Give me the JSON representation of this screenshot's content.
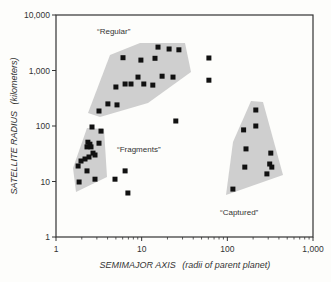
{
  "chart_data": {
    "type": "scatter",
    "title": "",
    "xlabel": "SEMIMAJOR AXIS",
    "xlabel_units": "(radii of parent planet)",
    "ylabel": "SATELLITE RADIUS",
    "ylabel_units": "(kilometers)",
    "xscale": "log",
    "yscale": "log",
    "xlim": [
      1,
      1000
    ],
    "ylim": [
      1,
      10000
    ],
    "xticks": [
      {
        "v": 1,
        "label": "1"
      },
      {
        "v": 10,
        "label": "10"
      },
      {
        "v": 100,
        "label": "100"
      },
      {
        "v": 1000,
        "label": "1,000"
      }
    ],
    "yticks": [
      {
        "v": 1,
        "label": "1"
      },
      {
        "v": 10,
        "label": "10"
      },
      {
        "v": 100,
        "label": "100"
      },
      {
        "v": 1000,
        "label": "1,000"
      },
      {
        "v": 10000,
        "label": "10,000"
      }
    ],
    "grid": false,
    "colors": {
      "marker": "#111111",
      "region": "#cfcfcf",
      "axis": "#333333"
    },
    "regions": [
      {
        "name": "“Regular”",
        "label_pos": [
          97,
          34
        ],
        "polygon": [
          [
            110,
            55
          ],
          [
            140,
            43
          ],
          [
            185,
            43
          ],
          [
            191,
            72
          ],
          [
            148,
            103
          ],
          [
            100,
            117
          ],
          [
            88,
            113
          ]
        ]
      },
      {
        "name": "“Fragments”",
        "label_pos": [
          117,
          152
        ],
        "polygon": [
          [
            87,
            128
          ],
          [
            104,
            129
          ],
          [
            107,
            177
          ],
          [
            76,
            192
          ],
          [
            73,
            168
          ]
        ]
      },
      {
        "name": "“Captured”",
        "label_pos": [
          220,
          215
        ],
        "polygon": [
          [
            251,
            101
          ],
          [
            263,
            102
          ],
          [
            283,
            175
          ],
          [
            226,
            195
          ],
          [
            233,
            142
          ]
        ]
      }
    ],
    "series": [
      {
        "name": "Regular",
        "points": [
          [
            15.5,
            2640
          ],
          [
            20.9,
            2440
          ],
          [
            27.2,
            2360
          ],
          [
            6.06,
            1700
          ],
          [
            9.8,
            1540
          ],
          [
            14.3,
            1660
          ],
          [
            9.06,
            760
          ],
          [
            17.3,
            790
          ],
          [
            23.2,
            760
          ],
          [
            5.0,
            505
          ],
          [
            6.4,
            570
          ],
          [
            7.5,
            570
          ],
          [
            10.6,
            570
          ],
          [
            13.5,
            545
          ],
          [
            4.04,
            250
          ],
          [
            5.15,
            240
          ],
          [
            3.18,
            186
          ]
        ]
      },
      {
        "name": "Fragments",
        "points": [
          [
            2.63,
            96
          ],
          [
            3.35,
            81
          ],
          [
            2.36,
            51
          ],
          [
            2.49,
            47
          ],
          [
            2.56,
            42
          ],
          [
            3.18,
            49
          ],
          [
            2.3,
            42
          ],
          [
            2.7,
            32.5
          ],
          [
            2.85,
            30
          ],
          [
            2.43,
            27.6
          ],
          [
            2.18,
            25.4
          ],
          [
            1.96,
            23.4
          ],
          [
            1.81,
            19
          ],
          [
            2.3,
            15.5
          ],
          [
            1.86,
            9.8
          ],
          [
            2.85,
            11
          ]
        ]
      },
      {
        "name": "Unclassified",
        "points": [
          [
            6.4,
            15.5
          ],
          [
            4.88,
            11
          ],
          [
            6.9,
            6.2
          ],
          [
            61,
            1680
          ],
          [
            61,
            670
          ],
          [
            25,
            123
          ]
        ]
      },
      {
        "name": "Captured",
        "points": [
          [
            215,
            194
          ],
          [
            215,
            100
          ],
          [
            155,
            85
          ],
          [
            165,
            38.6
          ],
          [
            160,
            18.2
          ],
          [
            322,
            32.5
          ],
          [
            312,
            20.7
          ],
          [
            330,
            18.2
          ],
          [
            290,
            13.7
          ],
          [
            116,
            7.3
          ]
        ]
      }
    ]
  }
}
